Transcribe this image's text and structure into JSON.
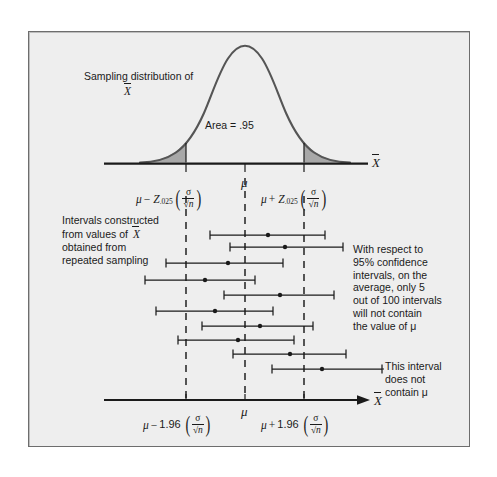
{
  "figure": {
    "background_color": "#eeeeee",
    "frame_border_color": "#6d6d6d",
    "curve_color": "#555555",
    "tail_fill_color": "#a8a8a8",
    "axis_color": "#1a1a1a",
    "dashed_line_color": "#1a1a1a",
    "labels": {
      "sampling_distribution_line1": "Sampling distribution of",
      "sampling_distribution_line2": "X",
      "area_label": "Area  =  .95",
      "top_axis_variable": "X",
      "bottom_axis_variable": "X",
      "mu_center_top": "μ",
      "mu_center_bottom": "μ",
      "left_tick_top": {
        "mu": "μ",
        "operator": "−",
        "z": "Z",
        "z_subscript": ".025",
        "numerator": "σ",
        "denominator": "√n"
      },
      "right_tick_top": {
        "mu": "μ",
        "operator": "+",
        "z": "Z",
        "z_subscript": ".025",
        "numerator": "σ",
        "denominator": "√n"
      },
      "left_tick_bottom": {
        "mu": "μ",
        "operator": "−",
        "coefficient": "1.96",
        "numerator": "σ",
        "denominator": "√n"
      },
      "right_tick_bottom": {
        "mu": "μ",
        "operator": "+",
        "coefficient": "1.96",
        "numerator": "σ",
        "denominator": "√n"
      },
      "intervals_caption": [
        "Intervals constructed",
        "from values of",
        "obtained from",
        "repeated sampling"
      ],
      "intervals_caption_line1": "Intervals constructed",
      "intervals_caption_line2_pre": "from values of",
      "intervals_caption_line2_var": "X",
      "intervals_caption_line3": "obtained from",
      "intervals_caption_line4": "repeated sampling",
      "respect_note": "With respect to 95% confidence intervals, on the average, only 5 out of 100 intervals will not contain the value of μ",
      "respect_note_lines": [
        "With respect to",
        "95% confidence",
        "intervals, on the",
        "average, only 5",
        "out of 100 intervals",
        "will not contain",
        "the value of μ"
      ],
      "not_contain_note": "This interval does not contain μ",
      "not_contain_note_lines": [
        "This interval",
        "does not",
        "contain μ"
      ]
    }
  },
  "chart_data": {
    "type": "line",
    "xlabel": "X̄",
    "ylabel": "",
    "grid": false,
    "legend": "none",
    "distribution": {
      "kind": "normal-density",
      "mean_label": "μ",
      "center_x_px": 245,
      "baseline_y_px": 163,
      "peak_y_px": 48,
      "shaded_area": 0.95,
      "area_label": "Area  =  .95",
      "critical_value": 1.96,
      "z_alpha_over_2": ".025",
      "lower_bound_x_px": 186,
      "upper_bound_x_px": 304,
      "tail_area_each": 0.025
    },
    "axis": {
      "mu_x_px": 245,
      "lower_tick_x_px": 186,
      "upper_tick_x_px": 304,
      "lower_tick_label": "μ − 1.96 (σ/√n)",
      "mu_tick_label": "μ",
      "upper_tick_label": "μ + 1.96 (σ/√n)"
    },
    "confidence_level": 0.95,
    "intervals_total_note": "5 out of 100",
    "intervals": [
      {
        "index": 1,
        "left_px": 210,
        "right_px": 325,
        "point_px": 268,
        "y_px": 235,
        "contains_mu": true
      },
      {
        "index": 2,
        "left_px": 230,
        "right_px": 343,
        "point_px": 285,
        "y_px": 247,
        "contains_mu": true
      },
      {
        "index": 3,
        "left_px": 166,
        "right_px": 283,
        "point_px": 228,
        "y_px": 263,
        "contains_mu": true
      },
      {
        "index": 4,
        "left_px": 145,
        "right_px": 255,
        "point_px": 205,
        "y_px": 280,
        "contains_mu": true
      },
      {
        "index": 5,
        "left_px": 224,
        "right_px": 334,
        "point_px": 280,
        "y_px": 295,
        "contains_mu": true
      },
      {
        "index": 6,
        "left_px": 156,
        "right_px": 273,
        "point_px": 215,
        "y_px": 311,
        "contains_mu": true
      },
      {
        "index": 7,
        "left_px": 202,
        "right_px": 313,
        "point_px": 260,
        "y_px": 326,
        "contains_mu": true
      },
      {
        "index": 8,
        "left_px": 178,
        "right_px": 294,
        "point_px": 238,
        "y_px": 340,
        "contains_mu": true
      },
      {
        "index": 9,
        "left_px": 233,
        "right_px": 346,
        "point_px": 290,
        "y_px": 354,
        "contains_mu": true
      },
      {
        "index": 10,
        "left_px": 272,
        "right_px": 382,
        "point_px": 322,
        "y_px": 369,
        "contains_mu": false
      }
    ]
  }
}
